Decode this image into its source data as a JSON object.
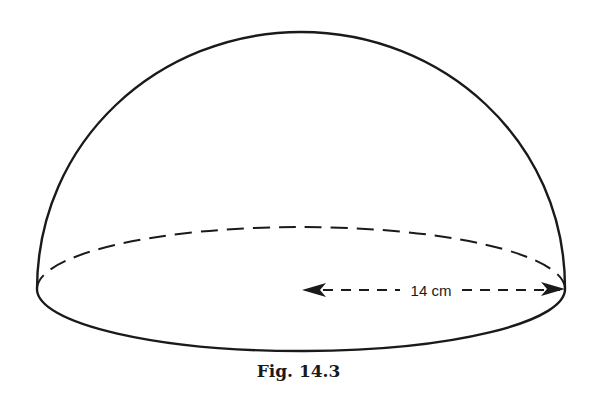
{
  "figure": {
    "caption": "Fig. 14.3",
    "shape": "hemisphere",
    "dimension": {
      "label": "14 cm",
      "type": "radius"
    },
    "colors": {
      "stroke": "#1a1a1a",
      "background": "#ffffff"
    }
  }
}
